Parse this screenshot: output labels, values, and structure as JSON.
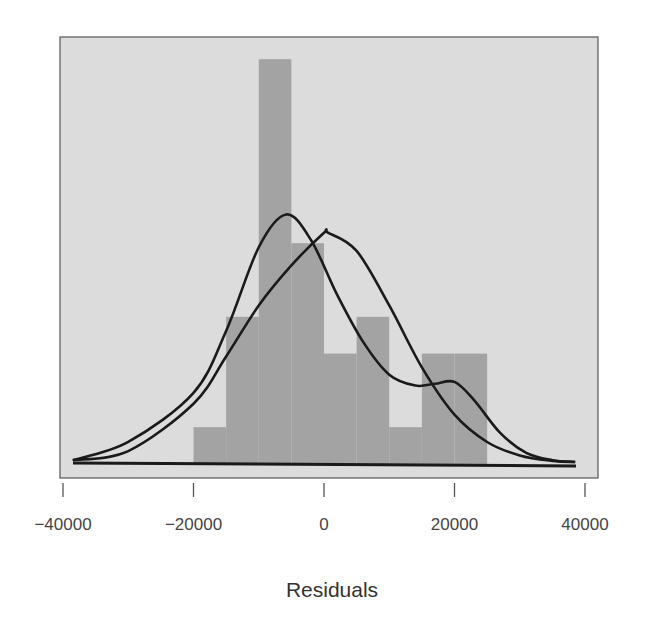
{
  "chart_data": {
    "type": "bar",
    "subtype": "histogram_with_density",
    "title": "",
    "xlabel": "Residuals",
    "ylabel": "",
    "xlim": [
      -40000,
      40000
    ],
    "x_ticks": [
      -40000,
      -20000,
      0,
      20000,
      40000
    ],
    "x_tick_labels": [
      "−40000",
      "−20000",
      "0",
      "20000",
      "40000"
    ],
    "y_axis_shown": false,
    "grid": false,
    "legend": null,
    "bins": [
      {
        "start": -20000,
        "end": -15000,
        "count": 1
      },
      {
        "start": -15000,
        "end": -10000,
        "count": 4
      },
      {
        "start": -10000,
        "end": -5000,
        "count": 11
      },
      {
        "start": -5000,
        "end": 0,
        "count": 6
      },
      {
        "start": 0,
        "end": 5000,
        "count": 3
      },
      {
        "start": 5000,
        "end": 10000,
        "count": 4
      },
      {
        "start": 10000,
        "end": 15000,
        "count": 1
      },
      {
        "start": 15000,
        "end": 20000,
        "count": 3
      },
      {
        "start": 20000,
        "end": 25000,
        "count": 3
      }
    ],
    "categories": [
      "-20000 to -15000",
      "-15000 to -10000",
      "-10000 to -5000",
      "-5000 to 0",
      "0 to 5000",
      "5000 to 10000",
      "10000 to 15000",
      "15000 to 20000",
      "20000 to 25000"
    ],
    "values": [
      1,
      4,
      11,
      6,
      3,
      4,
      1,
      3,
      3
    ],
    "series": [
      {
        "name": "kernel density",
        "type": "line",
        "points": [
          [
            -38500,
            0.05
          ],
          [
            -30000,
            0.55
          ],
          [
            -20000,
            1.9
          ],
          [
            -15000,
            3.6
          ],
          [
            -10000,
            5.9
          ],
          [
            -5800,
            6.8
          ],
          [
            -2000,
            6.1
          ],
          [
            2000,
            4.6
          ],
          [
            6000,
            3.3
          ],
          [
            10000,
            2.4
          ],
          [
            14000,
            2.1
          ],
          [
            17000,
            2.15
          ],
          [
            20000,
            2.2
          ],
          [
            23000,
            1.7
          ],
          [
            27000,
            0.8
          ],
          [
            31000,
            0.25
          ],
          [
            35000,
            0.05
          ],
          [
            38500,
            0.0
          ]
        ]
      },
      {
        "name": "normal density",
        "type": "line",
        "points": [
          [
            -38500,
            0.05
          ],
          [
            -30000,
            0.3
          ],
          [
            -20000,
            1.6
          ],
          [
            -15000,
            2.9
          ],
          [
            -10000,
            4.3
          ],
          [
            -5000,
            5.4
          ],
          [
            0,
            6.3
          ],
          [
            600,
            6.3
          ],
          [
            5000,
            5.8
          ],
          [
            10000,
            4.3
          ],
          [
            15000,
            2.6
          ],
          [
            20000,
            1.3
          ],
          [
            25000,
            0.55
          ],
          [
            30000,
            0.18
          ],
          [
            35000,
            0.03
          ],
          [
            38500,
            0.0
          ]
        ]
      }
    ],
    "colors": {
      "panel_background": "#dcdcdc",
      "bars": "#a3a3a3",
      "lines": "#1a1a1a",
      "frame": "#555555",
      "page_background": "#ffffff"
    }
  }
}
